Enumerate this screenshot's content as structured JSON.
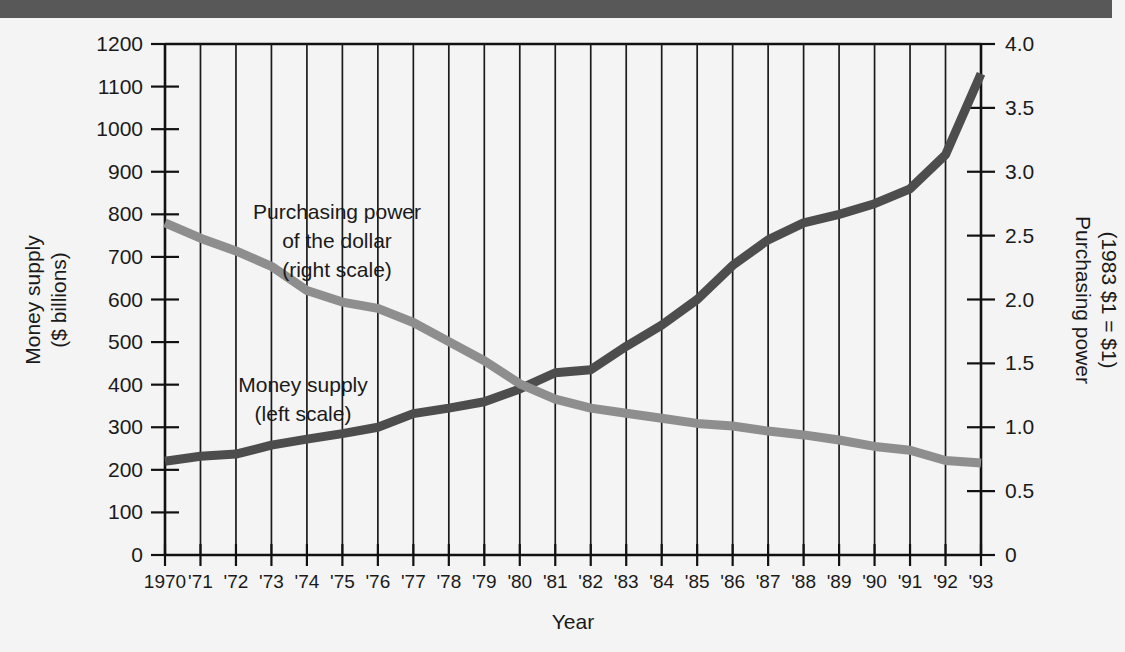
{
  "figure": {
    "background_color": "#f4f4f4",
    "top_band_color": "#585858"
  },
  "chart_data": {
    "type": "line",
    "title": "",
    "xlabel": "Year",
    "ylabel": "Money supply\n($ billions)",
    "y2label": "Purchasing power\n(1983 $1 = $1)",
    "grid": true,
    "legend_position": "inside-annotations",
    "x": [
      1970,
      1971,
      1972,
      1973,
      1974,
      1975,
      1976,
      1977,
      1978,
      1979,
      1980,
      1981,
      1982,
      1983,
      1984,
      1985,
      1986,
      1987,
      1988,
      1989,
      1990,
      1991,
      1992,
      1993
    ],
    "categories": [
      "1970",
      "'71",
      "'72",
      "'73",
      "'74",
      "'75",
      "'76",
      "'77",
      "'78",
      "'79",
      "'80",
      "'81",
      "'82",
      "'83",
      "'84",
      "'85",
      "'86",
      "'87",
      "'88",
      "'89",
      "'90",
      "'91",
      "'92",
      "'93"
    ],
    "ylim": [
      0,
      1200
    ],
    "yticks": [
      0,
      100,
      200,
      300,
      400,
      500,
      600,
      700,
      800,
      900,
      1000,
      1100,
      1200
    ],
    "ytick_labels": [
      "0",
      "100",
      "200",
      "300",
      "400",
      "500",
      "600",
      "700",
      "800",
      "900",
      "1000",
      "1100",
      "1200"
    ],
    "y2lim": [
      0,
      4.0
    ],
    "y2ticks": [
      0,
      0.5,
      1.0,
      1.5,
      2.0,
      2.5,
      3.0,
      3.5,
      4.0
    ],
    "y2tick_labels": [
      "0",
      "0.5",
      "1.0",
      "1.5",
      "2.0",
      "2.5",
      "3.0",
      "3.5",
      "4.0"
    ],
    "series": [
      {
        "name": "Money supply",
        "annotation": "Money supply\n(left scale)",
        "axis": "left",
        "color": "#4d4d4d",
        "line_width": 9,
        "values": [
          220,
          232,
          237,
          258,
          272,
          285,
          300,
          332,
          345,
          360,
          390,
          428,
          435,
          490,
          540,
          600,
          680,
          740,
          780,
          800,
          825,
          860,
          940,
          1130
        ]
      },
      {
        "name": "Purchasing power of the dollar",
        "annotation": "Purchasing power\nof the dollar\n(right scale)",
        "axis": "right",
        "color": "#8e8e8e",
        "line_width": 9,
        "values": [
          2.6,
          2.48,
          2.38,
          2.26,
          2.07,
          1.98,
          1.93,
          1.82,
          1.67,
          1.52,
          1.34,
          1.22,
          1.15,
          1.11,
          1.07,
          1.03,
          1.01,
          0.97,
          0.94,
          0.9,
          0.85,
          0.82,
          0.74,
          0.72
        ]
      }
    ],
    "annotations": [
      {
        "id": "purchasing-power-annotation",
        "lines": [
          "Purchasing power",
          "of the dollar",
          "(right scale)"
        ],
        "x_px": 337,
        "y_px": 195
      },
      {
        "id": "money-supply-annotation",
        "lines": [
          "Money supply",
          "(left scale)"
        ],
        "x_px": 303,
        "y_px": 368
      }
    ]
  },
  "axes": {
    "x_axis_title": "Year",
    "left_axis_title_lines": [
      "Money supply",
      "($ billions)"
    ],
    "right_axis_title_lines": [
      "Purchasing power",
      "(1983 $1 = $1)"
    ]
  }
}
